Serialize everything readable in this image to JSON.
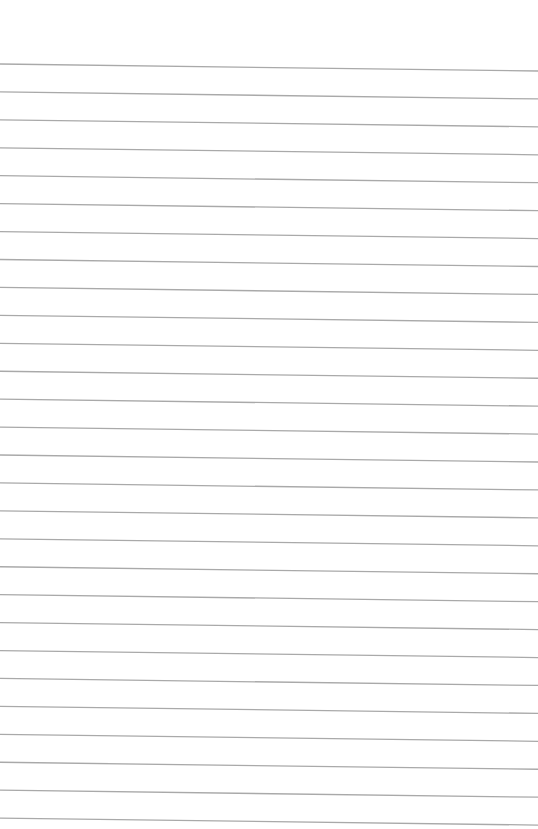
{
  "page": {
    "type": "lined-paper",
    "background_color": "#ffffff",
    "line_color": "#a9a9a9",
    "line_count": 28,
    "first_line_y_left": 64,
    "line_spacing": 27.93,
    "slope_drop_px": 7,
    "line_width": 1.3
  }
}
